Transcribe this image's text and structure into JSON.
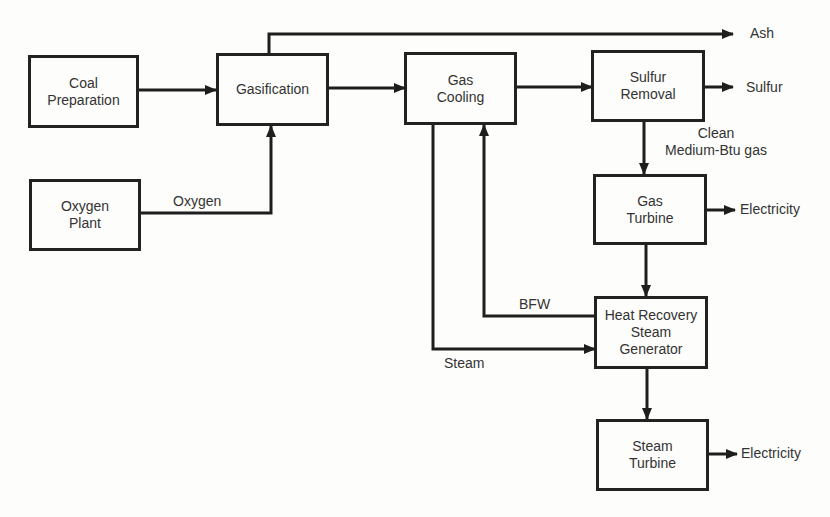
{
  "diagram": {
    "type": "process-flow",
    "nodes": [
      {
        "id": "coal_preparation",
        "label": "Coal\nPreparation"
      },
      {
        "id": "gasification",
        "label": "Gasification"
      },
      {
        "id": "oxygen_plant",
        "label": "Oxygen\nPlant"
      },
      {
        "id": "gas_cooling",
        "label": "Gas\nCooling"
      },
      {
        "id": "sulfur_removal",
        "label": "Sulfur\nRemoval"
      },
      {
        "id": "gas_turbine",
        "label": "Gas\nTurbine"
      },
      {
        "id": "hrsg",
        "label": "Heat Recovery\nSteam\nGenerator"
      },
      {
        "id": "steam_turbine",
        "label": "Steam\nTurbine"
      }
    ],
    "edge_labels": {
      "oxygen": "Oxygen",
      "ash": "Ash",
      "sulfur": "Sulfur",
      "clean_gas": "Clean\nMedium-Btu gas",
      "electricity_gas": "Electricity",
      "electricity_steam": "Electricity",
      "bfw": "BFW",
      "steam": "Steam"
    },
    "edges": [
      {
        "from": "coal_preparation",
        "to": "gasification"
      },
      {
        "from": "oxygen_plant",
        "to": "gasification",
        "label": "Oxygen"
      },
      {
        "from": "gasification",
        "to": "ash_output",
        "label": "Ash"
      },
      {
        "from": "gasification",
        "to": "gas_cooling"
      },
      {
        "from": "gas_cooling",
        "to": "sulfur_removal"
      },
      {
        "from": "sulfur_removal",
        "to": "sulfur_output",
        "label": "Sulfur"
      },
      {
        "from": "sulfur_removal",
        "to": "gas_turbine",
        "label": "Clean Medium-Btu gas"
      },
      {
        "from": "gas_turbine",
        "to": "electricity_output",
        "label": "Electricity"
      },
      {
        "from": "gas_turbine",
        "to": "hrsg"
      },
      {
        "from": "hrsg",
        "to": "gas_cooling",
        "label": "BFW"
      },
      {
        "from": "gas_cooling",
        "to": "hrsg",
        "label": "Steam"
      },
      {
        "from": "hrsg",
        "to": "steam_turbine"
      },
      {
        "from": "steam_turbine",
        "to": "electricity_output",
        "label": "Electricity"
      }
    ]
  }
}
